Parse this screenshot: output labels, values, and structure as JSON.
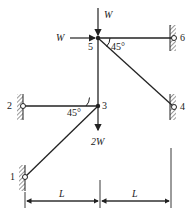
{
  "diagram": {
    "type": "truss",
    "nodes": [
      {
        "id": "1",
        "label": "1"
      },
      {
        "id": "2",
        "label": "2"
      },
      {
        "id": "3",
        "label": "3"
      },
      {
        "id": "4",
        "label": "4"
      },
      {
        "id": "5",
        "label": "5"
      },
      {
        "id": "6",
        "label": "6"
      }
    ],
    "members": [
      [
        "1",
        "3"
      ],
      [
        "2",
        "3"
      ],
      [
        "3",
        "5"
      ],
      [
        "5",
        "6"
      ],
      [
        "5",
        "4"
      ]
    ],
    "loads": {
      "node5_vertical": "W",
      "node5_horizontal": "W",
      "node3_vertical": "2W"
    },
    "angles": {
      "at_node5": "45°",
      "at_node3": "45°"
    },
    "dimensions": {
      "left_span": "L",
      "right_span": "L"
    }
  }
}
